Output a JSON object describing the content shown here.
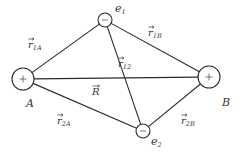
{
  "diagram": {
    "nodes": [
      {
        "id": "A",
        "label": "A",
        "charge": "+",
        "cx": 23,
        "cy": 79,
        "r": 11,
        "label_x": 26,
        "label_y": 107
      },
      {
        "id": "B",
        "label": "B",
        "charge": "+",
        "cx": 209,
        "cy": 77,
        "r": 11,
        "label_x": 222,
        "label_y": 106
      },
      {
        "id": "e1",
        "label": "e",
        "label_sub": "1",
        "charge": "−",
        "cx": 105,
        "cy": 20,
        "r": 7,
        "label_x": 115,
        "label_y": 12
      },
      {
        "id": "e2",
        "label": "e",
        "label_sub": "2",
        "charge": "−",
        "cx": 143,
        "cy": 131,
        "r": 7,
        "label_x": 151,
        "label_y": 145
      }
    ],
    "edges": [
      {
        "from": "A",
        "to": "e1",
        "label": "r",
        "sub": "1A",
        "lx": 28,
        "ly": 48
      },
      {
        "from": "e1",
        "to": "B",
        "label": "r",
        "sub": "1B",
        "lx": 148,
        "ly": 36
      },
      {
        "from": "e1",
        "to": "e2",
        "label": "r",
        "sub": "12",
        "lx": 118,
        "ly": 67
      },
      {
        "from": "A",
        "to": "B",
        "label": "R",
        "sub": "",
        "lx": 92,
        "ly": 95
      },
      {
        "from": "A",
        "to": "e2",
        "label": "r",
        "sub": "2A",
        "lx": 57,
        "ly": 124
      },
      {
        "from": "e2",
        "to": "B",
        "label": "r",
        "sub": "2B",
        "lx": 181,
        "ly": 124
      }
    ]
  }
}
